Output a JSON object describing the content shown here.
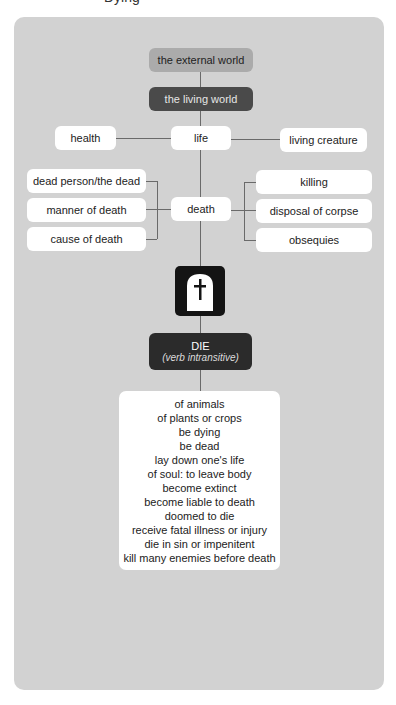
{
  "header": {
    "cut_title": "Dying"
  },
  "nodes": {
    "external_world": "the external world",
    "living_world": "the living world",
    "health": "health",
    "life": "life",
    "living_creature": "living creature",
    "death": "death",
    "left": [
      "dead person/the dead",
      "manner of death",
      "cause of death"
    ],
    "right": [
      "killing",
      "disposal of corpse",
      "obsequies"
    ],
    "die": {
      "title": "DIE",
      "subtitle": "(verb intransitive)"
    }
  },
  "icon": {
    "name": "gravestone-cross-icon"
  },
  "senses": [
    "of animals",
    "of plants or crops",
    "be dying",
    "be dead",
    "lay down one's life",
    "of soul: to leave body",
    "become extinct",
    "become liable to death",
    "doomed to die",
    "receive fatal illness or injury",
    "die in sin or impenitent",
    "kill many enemies before death"
  ],
  "colors": {
    "panel": "#d2d2d2",
    "external_world": "#ababab",
    "living_world": "#4a4a4a",
    "die": "#2b2b2b",
    "icon": "#141414",
    "connector": "#6a6a6a"
  }
}
